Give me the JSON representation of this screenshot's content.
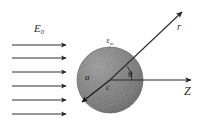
{
  "figure": {
    "background_color": "#ffffff",
    "width": 206,
    "height": 133
  },
  "incident_field": {
    "label": "E",
    "subscript": "0",
    "label_full": "E0",
    "arrow_count": 6,
    "arrow_color": "#2e2e2e",
    "x_start": 12,
    "x_end": 66,
    "arrow_y": [
      45,
      58,
      72,
      86,
      100,
      114
    ],
    "label_x": 34,
    "label_y": 32
  },
  "sphere": {
    "medium_label": "ε",
    "medium_subscript": "m",
    "medium_label_full": "εm",
    "medium_label_x": 110,
    "medium_label_y": 43,
    "center_x": 110,
    "center_y": 80,
    "radius": 33,
    "fill_color": "#7a7a7a",
    "highlight_color": "#9a9a9a",
    "shadow_color": "#5d5d5d",
    "edge_color": "#4a4a4a"
  },
  "radius_vector": {
    "label": "a",
    "label_x": 88,
    "label_y": 79,
    "tip_x": 82,
    "tip_y": 102,
    "color": "#141414"
  },
  "center_label": {
    "label": "c",
    "label_x": 108,
    "label_y": 90
  },
  "angle": {
    "label": "θ",
    "label_x": 128,
    "label_y": 77,
    "arc_radius": 22,
    "degrees": 38
  },
  "r_vector": {
    "label": "r",
    "label_x": 177,
    "label_y": 30,
    "tip_x": 182,
    "tip_y": 12,
    "color": "#2b2b2b"
  },
  "z_axis": {
    "label": "Z",
    "label_x": 184,
    "label_y": 95,
    "tip_x": 191,
    "tip_y": 80,
    "color": "#2b2b2b"
  }
}
